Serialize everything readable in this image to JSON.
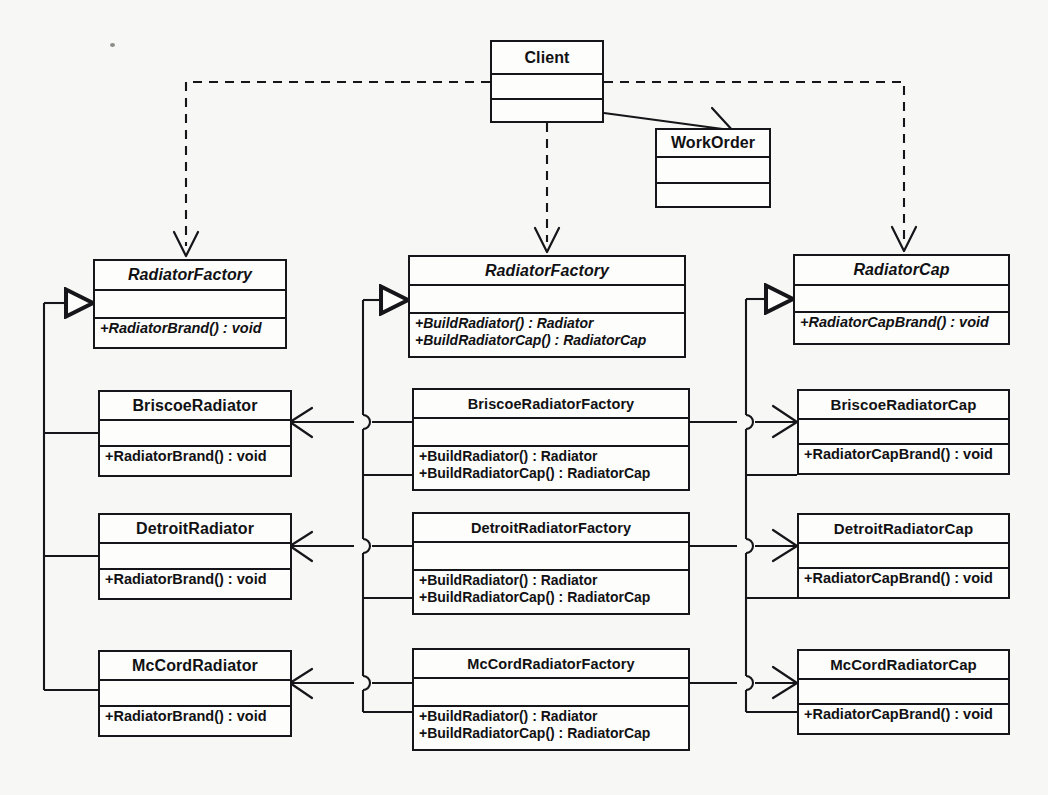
{
  "diagram": {
    "type": "uml-class-diagram",
    "background_color": "#f7f7f5",
    "line_color": "#16161a",
    "box_fill": "#fdfdfb"
  },
  "classes": {
    "client": {
      "name": "Client",
      "abstract": false,
      "attributes": [],
      "operations": [],
      "x": 490,
      "y": 40,
      "w": 114,
      "h": 83,
      "name_h": 33,
      "attr_h": 25
    },
    "work_order": {
      "name": "WorkOrder",
      "abstract": false,
      "attributes": [],
      "operations": [],
      "x": 655,
      "y": 128,
      "w": 116,
      "h": 80,
      "name_h": 28,
      "attr_h": 26
    },
    "radiator_abstract": {
      "name": "RadiatorFactory",
      "abstract": true,
      "attributes": [],
      "operations": [
        "+RadiatorBrand() : void"
      ],
      "x": 93,
      "y": 259,
      "w": 194,
      "h": 90,
      "name_h": 30,
      "attr_h": 28
    },
    "briscoe_radiator": {
      "name": "BriscoeRadiator",
      "abstract": false,
      "attributes": [],
      "operations": [
        "+RadiatorBrand() : void"
      ],
      "x": 98,
      "y": 390,
      "w": 194,
      "h": 87,
      "name_h": 29,
      "attr_h": 26
    },
    "detroit_radiator": {
      "name": "DetroitRadiator",
      "abstract": false,
      "attributes": [],
      "operations": [
        "+RadiatorBrand() : void"
      ],
      "x": 98,
      "y": 513,
      "w": 194,
      "h": 87,
      "name_h": 29,
      "attr_h": 26
    },
    "mccord_radiator": {
      "name": "McCordRadiator",
      "abstract": false,
      "attributes": [],
      "operations": [
        "+RadiatorBrand() : void"
      ],
      "x": 98,
      "y": 650,
      "w": 194,
      "h": 87,
      "name_h": 29,
      "attr_h": 26
    },
    "factory_abstract": {
      "name": "RadiatorFactory",
      "abstract": true,
      "attributes": [],
      "operations": [
        "+BuildRadiator() : Radiator",
        "+BuildRadiatorCap() : RadiatorCap"
      ],
      "x": 408,
      "y": 255,
      "w": 278,
      "h": 103,
      "name_h": 29,
      "attr_h": 28
    },
    "briscoe_factory": {
      "name": "BriscoeRadiatorFactory",
      "abstract": false,
      "attributes": [],
      "operations": [
        "+BuildRadiator() : Radiator",
        "+BuildRadiatorCap() : RadiatorCap"
      ],
      "x": 412,
      "y": 388,
      "w": 278,
      "h": 103,
      "name_h": 29,
      "attr_h": 28
    },
    "detroit_factory": {
      "name": "DetroitRadiatorFactory",
      "abstract": false,
      "attributes": [],
      "operations": [
        "+BuildRadiator() : Radiator",
        "+BuildRadiatorCap() : RadiatorCap"
      ],
      "x": 412,
      "y": 512,
      "w": 278,
      "h": 103,
      "name_h": 29,
      "attr_h": 28
    },
    "mccord_factory": {
      "name": "McCordRadiatorFactory",
      "abstract": false,
      "attributes": [],
      "operations": [
        "+BuildRadiator() : Radiator",
        "+BuildRadiatorCap() : RadiatorCap"
      ],
      "x": 412,
      "y": 648,
      "w": 278,
      "h": 103,
      "name_h": 29,
      "attr_h": 28
    },
    "cap_abstract": {
      "name": "RadiatorCap",
      "abstract": true,
      "attributes": [],
      "operations": [
        "+RadiatorCapBrand() : void"
      ],
      "x": 793,
      "y": 254,
      "w": 217,
      "h": 91,
      "name_h": 30,
      "attr_h": 27
    },
    "briscoe_cap": {
      "name": "BriscoeRadiatorCap",
      "abstract": false,
      "attributes": [],
      "operations": [
        "+RadiatorCapBrand() : void"
      ],
      "x": 797,
      "y": 389,
      "w": 213,
      "h": 86,
      "name_h": 29,
      "attr_h": 25
    },
    "detroit_cap": {
      "name": "DetroitRadiatorCap",
      "abstract": false,
      "attributes": [],
      "operations": [
        "+RadiatorCapBrand() : void"
      ],
      "x": 797,
      "y": 513,
      "w": 213,
      "h": 86,
      "name_h": 29,
      "attr_h": 25
    },
    "mccord_cap": {
      "name": "McCordRadiatorCap",
      "abstract": false,
      "attributes": [],
      "operations": [
        "+RadiatorCapBrand() : void"
      ],
      "x": 797,
      "y": 649,
      "w": 213,
      "h": 86,
      "name_h": 29,
      "attr_h": 25
    }
  },
  "relationships": [
    {
      "kind": "dependency",
      "from": "client",
      "to": "radiator_abstract",
      "style": "dashed",
      "arrow": "open"
    },
    {
      "kind": "dependency",
      "from": "client",
      "to": "factory_abstract",
      "style": "dashed",
      "arrow": "open"
    },
    {
      "kind": "dependency",
      "from": "client",
      "to": "cap_abstract",
      "style": "dashed",
      "arrow": "open"
    },
    {
      "kind": "association",
      "from": "client",
      "to": "work_order",
      "style": "solid",
      "arrow": "open"
    },
    {
      "kind": "generalization",
      "from": "briscoe_radiator",
      "to": "radiator_abstract",
      "style": "solid",
      "arrow": "hollow-triangle"
    },
    {
      "kind": "generalization",
      "from": "detroit_radiator",
      "to": "radiator_abstract",
      "style": "solid",
      "arrow": "hollow-triangle"
    },
    {
      "kind": "generalization",
      "from": "mccord_radiator",
      "to": "radiator_abstract",
      "style": "solid",
      "arrow": "hollow-triangle"
    },
    {
      "kind": "generalization",
      "from": "briscoe_factory",
      "to": "factory_abstract",
      "style": "solid",
      "arrow": "hollow-triangle"
    },
    {
      "kind": "generalization",
      "from": "detroit_factory",
      "to": "factory_abstract",
      "style": "solid",
      "arrow": "hollow-triangle"
    },
    {
      "kind": "generalization",
      "from": "mccord_factory",
      "to": "factory_abstract",
      "style": "solid",
      "arrow": "hollow-triangle"
    },
    {
      "kind": "generalization",
      "from": "briscoe_cap",
      "to": "cap_abstract",
      "style": "solid",
      "arrow": "hollow-triangle"
    },
    {
      "kind": "generalization",
      "from": "detroit_cap",
      "to": "cap_abstract",
      "style": "solid",
      "arrow": "hollow-triangle"
    },
    {
      "kind": "generalization",
      "from": "mccord_cap",
      "to": "cap_abstract",
      "style": "solid",
      "arrow": "hollow-triangle"
    },
    {
      "kind": "association",
      "from": "briscoe_factory",
      "to": "briscoe_radiator",
      "style": "solid",
      "arrow": "open"
    },
    {
      "kind": "association",
      "from": "detroit_factory",
      "to": "detroit_radiator",
      "style": "solid",
      "arrow": "open"
    },
    {
      "kind": "association",
      "from": "mccord_factory",
      "to": "mccord_radiator",
      "style": "solid",
      "arrow": "open"
    },
    {
      "kind": "association",
      "from": "briscoe_factory",
      "to": "briscoe_cap",
      "style": "solid",
      "arrow": "open"
    },
    {
      "kind": "association",
      "from": "detroit_factory",
      "to": "detroit_cap",
      "style": "solid",
      "arrow": "open"
    },
    {
      "kind": "association",
      "from": "mccord_factory",
      "to": "mccord_cap",
      "style": "solid",
      "arrow": "open"
    }
  ]
}
